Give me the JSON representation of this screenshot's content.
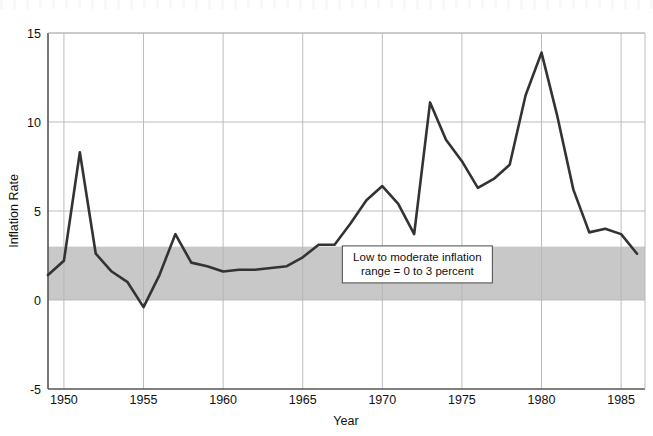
{
  "chart_data": {
    "type": "line",
    "title": "",
    "xlabel": "Year",
    "ylabel": "Inflation Rate",
    "xlim": [
      1949,
      1986.5
    ],
    "ylim": [
      -5,
      15
    ],
    "xticks": [
      1950,
      1955,
      1960,
      1965,
      1970,
      1975,
      1980,
      1985
    ],
    "yticks": [
      -5,
      0,
      5,
      10,
      15
    ],
    "xtick_labels": [
      "1950",
      "1955",
      "1960",
      "1965",
      "1970",
      "1975",
      "1980",
      "1985"
    ],
    "ytick_labels": [
      "-5",
      "0",
      "5",
      "10",
      "15"
    ],
    "grid": true,
    "legend": null,
    "line_color": "#333333",
    "band_color": "#c8c8c8",
    "grid_color": "#b4b4b4",
    "axis_color": "#555555",
    "x": [
      1949,
      1950,
      1951,
      1952,
      1953,
      1954,
      1955,
      1956,
      1957,
      1958,
      1959,
      1960,
      1961,
      1962,
      1963,
      1964,
      1965,
      1966,
      1967,
      1968,
      1969,
      1970,
      1971,
      1972,
      1973,
      1974,
      1975,
      1976,
      1977,
      1978,
      1979,
      1980,
      1981,
      1982,
      1983,
      1984,
      1985,
      1986
    ],
    "values": [
      1.4,
      2.2,
      8.3,
      2.6,
      1.6,
      1.0,
      -0.4,
      1.4,
      3.7,
      2.1,
      1.9,
      1.6,
      1.7,
      1.7,
      1.8,
      1.9,
      2.4,
      3.1,
      3.1,
      4.3,
      5.6,
      6.4,
      5.4,
      3.7,
      11.1,
      9.0,
      7.8,
      6.3,
      6.8,
      7.6,
      11.5,
      13.9,
      10.3,
      6.2,
      3.8,
      4.0,
      3.7,
      2.6
    ],
    "annotations": [
      {
        "name": "inflation-band-note",
        "line1": "Low to moderate inflation",
        "line2": "range = 0 to 3 percent",
        "x": 1972.2,
        "y": 2.0
      }
    ],
    "bands": [
      {
        "name": "low-to-moderate-inflation-band",
        "ymin": 0,
        "ymax": 3
      }
    ]
  }
}
